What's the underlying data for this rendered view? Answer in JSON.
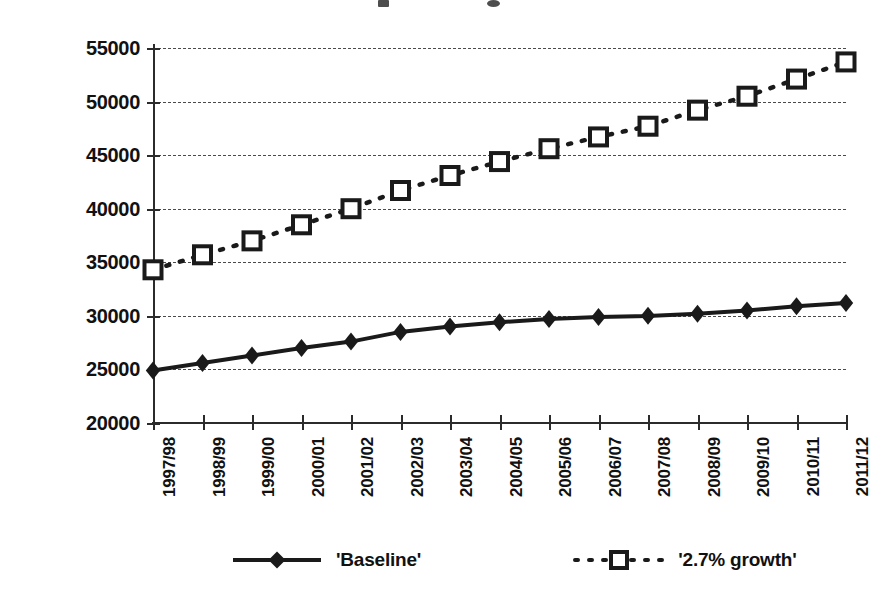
{
  "chart_data": {
    "type": "line",
    "title": "",
    "xlabel": "",
    "ylabel": "Forecast intakes to pre-registration nurse education",
    "ylim": [
      20000,
      55000
    ],
    "ytick_step": 5000,
    "yticks": [
      "20000",
      "25000",
      "30000",
      "35000",
      "40000",
      "45000",
      "50000",
      "55000"
    ],
    "ytick_values": [
      20000,
      25000,
      30000,
      35000,
      40000,
      45000,
      50000,
      55000
    ],
    "grid": true,
    "grid_style": "dashed-horizontal",
    "legend_position": "bottom",
    "categories": [
      "1997/98",
      "1998/99",
      "1999/00",
      "2000/01",
      "2001/02",
      "2002/03",
      "2003/04",
      "2004/05",
      "2005/06",
      "2006/07",
      "2007/08",
      "2008/09",
      "2009/10",
      "2010/11",
      "2011/12"
    ],
    "series": [
      {
        "name": "'Baseline'",
        "marker": "filled-diamond",
        "line": "solid",
        "color": "#1a1a1a",
        "values": [
          24900,
          25600,
          26300,
          27000,
          27600,
          28500,
          29000,
          29400,
          29700,
          29900,
          30000,
          30200,
          30500,
          30900,
          31200
        ]
      },
      {
        "name": "'2.7% growth'",
        "marker": "open-square",
        "line": "dotted",
        "color": "#1a1a1a",
        "values": [
          34300,
          35700,
          37000,
          38500,
          40000,
          41700,
          43100,
          44400,
          45600,
          46700,
          47700,
          49200,
          50500,
          52100,
          53700
        ]
      }
    ]
  },
  "legend": {
    "entries": [
      {
        "label": "'Baseline'",
        "marker": "filled-diamond",
        "line": "solid"
      },
      {
        "label": "'2.7% growth'",
        "marker": "open-square",
        "line": "dotted"
      }
    ]
  },
  "colors": {
    "ink": "#1a1a1a",
    "grid": "#4a4a4a",
    "axis": "#2b2b2b",
    "background": "#ffffff"
  }
}
